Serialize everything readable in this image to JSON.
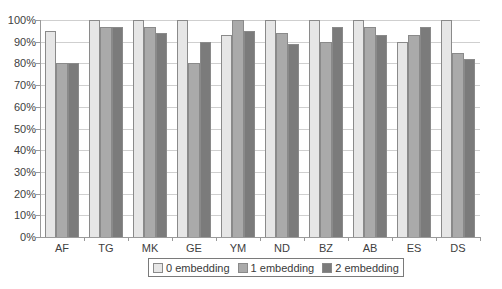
{
  "chart_data": {
    "type": "bar",
    "title": "",
    "xlabel": "",
    "ylabel": "",
    "ylim": [
      0,
      100
    ],
    "y_ticks": [
      "0%",
      "10%",
      "20%",
      "30%",
      "40%",
      "50%",
      "60%",
      "70%",
      "80%",
      "90%",
      "100%"
    ],
    "grid": true,
    "legend_position": "bottom",
    "categories": [
      "AF",
      "TG",
      "MK",
      "GE",
      "YM",
      "ND",
      "BZ",
      "AB",
      "ES",
      "DS"
    ],
    "series": [
      {
        "name": "0 embedding",
        "color": "#e6e6e6",
        "values": [
          95,
          100,
          100,
          100,
          93,
          100,
          100,
          100,
          90,
          100
        ]
      },
      {
        "name": "1 embedding",
        "color": "#aaaaaa",
        "values": [
          80,
          97,
          97,
          80,
          100,
          94,
          90,
          97,
          93,
          85
        ]
      },
      {
        "name": "2 embedding",
        "color": "#7b7b7b",
        "values": [
          80,
          97,
          94,
          90,
          95,
          89,
          97,
          93,
          97,
          82
        ]
      }
    ]
  },
  "legend": {
    "items": [
      {
        "label": "0 embedding",
        "color": "#e6e6e6"
      },
      {
        "label": "1 embedding",
        "color": "#aaaaaa"
      },
      {
        "label": "2 embedding",
        "color": "#7b7b7b"
      }
    ]
  }
}
